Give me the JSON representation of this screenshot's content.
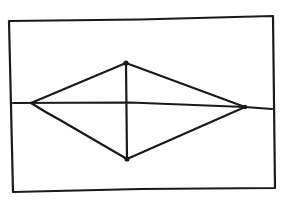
{
  "diagram": {
    "title": "",
    "ink_color": "#1a1a1a",
    "background_color": "#ffffff",
    "shapes": [
      {
        "id": "frame",
        "kind": "rectangle"
      },
      {
        "id": "horizontal-axis",
        "kind": "line"
      },
      {
        "id": "rhombus",
        "kind": "polygon",
        "vertices": [
          "left",
          "top",
          "right",
          "bottom"
        ]
      },
      {
        "id": "vertical-diagonal",
        "kind": "line",
        "from": "top",
        "to": "bottom"
      }
    ],
    "vertex_markers": [
      "top",
      "bottom",
      "right"
    ],
    "labels": []
  }
}
